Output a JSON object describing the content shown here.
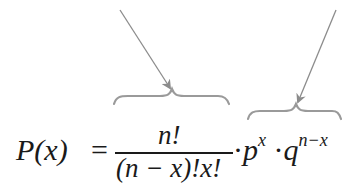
{
  "formula": {
    "lhs": "P(x)",
    "equals": "=",
    "numerator": "n!",
    "denominator": "(n − x)!x!",
    "dot1": "·",
    "p_base": "p",
    "p_exp": "x",
    "dot2": "·",
    "q_base": "q",
    "q_exp": "n−x",
    "latex": "P(x) = \\frac{n!}{(n-x)!x!} \\cdot p^x \\cdot q^{n-x}"
  },
  "annotations": [
    {
      "name": "combination-term-brace",
      "target": "n!/((n − x)!x!)"
    },
    {
      "name": "probability-term-brace",
      "target": "p^x · q^(n−x)"
    }
  ],
  "colors": {
    "ink": "#1a1a1a",
    "arrow": "#8c8c8c",
    "brace": "#9a9a9a",
    "background": "#ffffff"
  }
}
